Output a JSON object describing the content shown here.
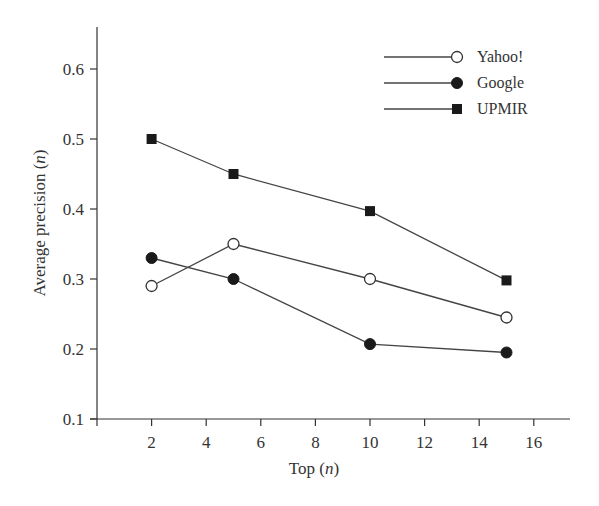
{
  "chart_data": {
    "type": "line",
    "title": "",
    "xlabel": "Top",
    "xlabel_var": "n",
    "ylabel": "Average precision",
    "ylabel_var": "n",
    "xlim": [
      0,
      17.5
    ],
    "ylim": [
      0.1,
      0.66
    ],
    "xticks": [
      2,
      4,
      6,
      8,
      10,
      12,
      14,
      16
    ],
    "yticks": [
      0.1,
      0.2,
      0.3,
      0.4,
      0.5,
      0.6
    ],
    "ytick_labels": [
      "0.1",
      "0.2",
      "0.3",
      "0.4",
      "0.5",
      "0.6"
    ],
    "grid": false,
    "legend_position": "top-right",
    "x": [
      2,
      5,
      10,
      15
    ],
    "series": [
      {
        "name": "Yahoo!",
        "marker": "open-circle",
        "values": [
          0.29,
          0.35,
          0.3,
          0.245
        ]
      },
      {
        "name": "Google",
        "marker": "filled-circle",
        "values": [
          0.33,
          0.3,
          0.207,
          0.195
        ]
      },
      {
        "name": "UPMIR",
        "marker": "filled-square",
        "values": [
          0.5,
          0.45,
          0.397,
          0.298
        ]
      }
    ]
  }
}
